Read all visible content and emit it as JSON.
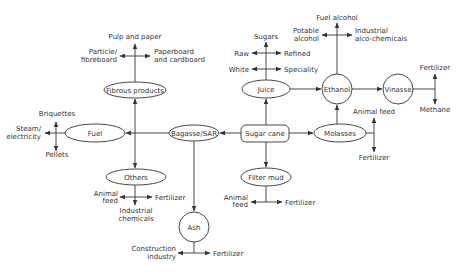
{
  "diagram": {
    "nodes": {
      "sugar_cane": "Sugar cane",
      "bagasse": "Bagasse/SAR",
      "molasses": "Molasses",
      "juice": "Juice",
      "ethanol": "Ethanol",
      "vinasse": "Vinasse",
      "fibrous": "Fibrous products",
      "fuel": "Fuel",
      "others": "Others",
      "filter_mud": "Filter mud",
      "ash": "Ash"
    },
    "fibrous_outputs": {
      "up": "Pulp and paper",
      "left_1": "Particle/",
      "left_2": "fibreboard",
      "right_1": "Paperboard",
      "right_2": "and cardboard"
    },
    "fuel_outputs": {
      "up": "Briquettes",
      "left_1": "Steam/",
      "left_2": "electricity",
      "down": "Pellets"
    },
    "others_outputs": {
      "left_1": "Animal",
      "left_2": "feed",
      "right": "Fertilizer",
      "down_1": "Industrial",
      "down_2": "chemicals"
    },
    "ash_outputs": {
      "left_1": "Construction",
      "left_2": "industry",
      "right": "Fertilizer"
    },
    "juice_outputs": {
      "up": "Sugars",
      "raw": "Raw",
      "refined": "Refined",
      "white": "White",
      "speciality": "Speciality"
    },
    "ethanol_outputs": {
      "up": "Fuel alcohol",
      "left_1": "Potable",
      "left_2": "alcohol",
      "right_1": "Industrial",
      "right_2": "alco-chemicals"
    },
    "vinasse_outputs": {
      "up": "Fertilizer",
      "down": "Methane"
    },
    "molasses_outputs": {
      "up": "Animal feed",
      "down": "Fertilizer"
    },
    "filter_mud_outputs": {
      "left_1": "Animal",
      "left_2": "feed",
      "right": "Fertilizer"
    }
  }
}
